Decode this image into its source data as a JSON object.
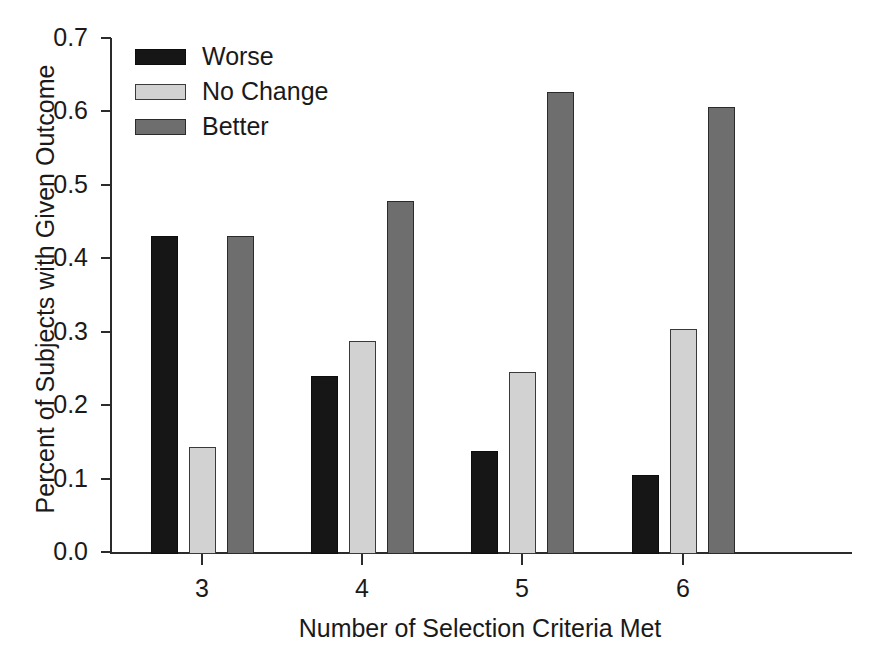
{
  "chart_data": {
    "type": "bar",
    "title": "",
    "xlabel": "Number of Selection Criteria Met",
    "ylabel": "Percent of Subjects with Given Outcome",
    "categories": [
      "3",
      "4",
      "5",
      "6"
    ],
    "series": [
      {
        "name": "Worse",
        "color": "#161616",
        "values": [
          0.43,
          0.24,
          0.138,
          0.105
        ]
      },
      {
        "name": "No Change",
        "color": "#d2d2d2",
        "values": [
          0.143,
          0.287,
          0.245,
          0.304
        ]
      },
      {
        "name": "Better",
        "color": "#6e6e6e",
        "values": [
          0.43,
          0.478,
          0.627,
          0.606
        ]
      }
    ],
    "ylim": [
      0.0,
      0.7
    ],
    "ytick_labels": [
      "0.0",
      "0.1",
      "0.2",
      "0.3",
      "0.4",
      "0.5",
      "0.6",
      "0.7"
    ],
    "ytick_values": [
      0.0,
      0.1,
      0.2,
      0.3,
      0.4,
      0.5,
      0.6,
      0.7
    ],
    "xtick_labels": [
      "3",
      "4",
      "5",
      "6"
    ],
    "grid": false,
    "legend_position": "top-left",
    "legend_entries": [
      "Worse",
      "No Change",
      "Better"
    ]
  }
}
